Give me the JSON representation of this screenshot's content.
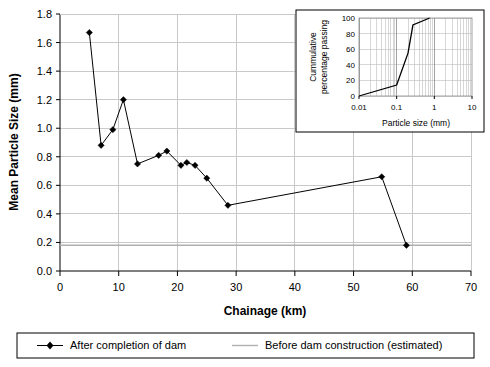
{
  "chart_data": {
    "type": "line",
    "title": "",
    "xlabel": "Chainage (km)",
    "ylabel": "Mean Particle Size (mm)",
    "xlim": [
      0,
      70
    ],
    "ylim": [
      0.0,
      1.8
    ],
    "xticks": [
      "0",
      "10",
      "20",
      "30",
      "40",
      "50",
      "60",
      "70"
    ],
    "xtick_values": [
      0,
      10,
      20,
      30,
      40,
      50,
      60,
      70
    ],
    "yticks": [
      "0.0",
      "0.2",
      "0.4",
      "0.6",
      "0.8",
      "1.0",
      "1.2",
      "1.4",
      "1.6",
      "1.8"
    ],
    "ytick_values": [
      0.0,
      0.2,
      0.4,
      0.6,
      0.8,
      1.0,
      1.2,
      1.4,
      1.6,
      1.8
    ],
    "grid": true,
    "legend_position": "bottom",
    "series": [
      {
        "name": "After completion of dam",
        "marker": "diamond",
        "color": "#000000",
        "x": [
          5.0,
          7.0,
          9.0,
          10.8,
          13.2,
          16.8,
          18.2,
          20.6,
          21.6,
          23.0,
          25.0,
          28.6,
          54.8,
          59.0
        ],
        "y": [
          1.67,
          0.88,
          0.99,
          1.2,
          0.75,
          0.81,
          0.84,
          0.74,
          0.76,
          0.74,
          0.65,
          0.46,
          0.66,
          0.18
        ]
      },
      {
        "name": "Before dam construction (estimated)",
        "marker": "none",
        "color": "#b0b0b0",
        "constant_y": 0.18,
        "x": [
          0,
          70
        ],
        "y": [
          0.18,
          0.18
        ]
      }
    ]
  },
  "inset_chart": {
    "type": "line",
    "xlabel": "Particle size (mm)",
    "ylabel": "Cummulative percentage passing",
    "ylabel_line1": "Cummulative",
    "ylabel_line2": "percentage passing",
    "xscale": "log",
    "xlim": [
      0.01,
      10
    ],
    "ylim": [
      0,
      100
    ],
    "xticks": [
      "0.01",
      "0.1",
      "1",
      "10"
    ],
    "xtick_values": [
      0.01,
      0.1,
      1,
      10
    ],
    "yticks": [
      "0",
      "20",
      "40",
      "60",
      "80",
      "100"
    ],
    "ytick_values": [
      0,
      20,
      40,
      60,
      80,
      100
    ],
    "grid": true,
    "series": [
      {
        "name": "Cummulative percentage passing",
        "color": "#000000",
        "x": [
          0.01,
          0.1,
          0.2,
          0.27,
          0.75
        ],
        "y": [
          0,
          14,
          55,
          91,
          100
        ]
      }
    ]
  },
  "legend": {
    "items": [
      {
        "label": "After completion of dam",
        "marker": "diamond-line",
        "color": "#000000"
      },
      {
        "label": "Before dam construction (estimated)",
        "marker": "line",
        "color": "#b0b0b0"
      }
    ]
  },
  "colors": {
    "series": "#000000",
    "reference": "#b0b0b0",
    "grid": "#c9c9c9",
    "axis": "#000000",
    "background": "#ffffff"
  }
}
